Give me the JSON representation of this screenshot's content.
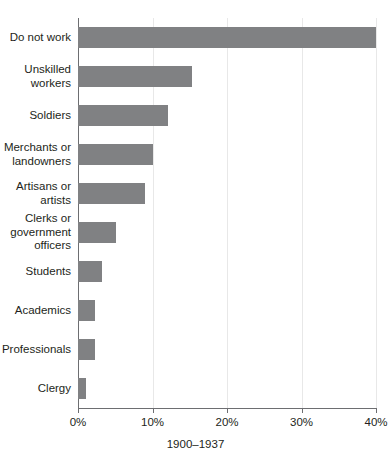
{
  "chart_data": {
    "type": "bar",
    "orientation": "horizontal",
    "title": "",
    "xlabel": "1900–1937",
    "ylabel": "",
    "xlim": [
      0,
      40
    ],
    "grid": true,
    "legend": false,
    "bar_color": "#808183",
    "axis_color": "#6d6e71",
    "gridline_color": "#e8e8e8",
    "xticks": [
      0,
      10,
      20,
      30,
      40
    ],
    "xtick_labels": [
      "0%",
      "10%",
      "20%",
      "30%",
      "40%"
    ],
    "categories": [
      "Do not work",
      "Unskilled\nworkers",
      "Soldiers",
      "Merchants or\nlandowners",
      "Artisans or\nartists",
      "Clerks or\ngovernment\nofficers",
      "Students",
      "Academics",
      "Professionals",
      "Clergy"
    ],
    "values": [
      40.0,
      15.3,
      12.1,
      10.0,
      9.0,
      5.1,
      3.2,
      2.3,
      2.3,
      1.1
    ]
  }
}
